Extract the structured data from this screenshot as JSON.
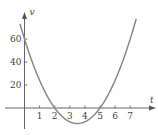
{
  "chart_data": {
    "type": "line",
    "title": "",
    "xlabel": "t",
    "ylabel": "v",
    "xlim": [
      -0.3,
      7.4
    ],
    "ylim": [
      -20,
      80
    ],
    "x_ticks": [
      1,
      2,
      3,
      4,
      5,
      6,
      7
    ],
    "x_tick_labels": [
      "1",
      "2",
      "3",
      "4",
      "5",
      "6",
      "7"
    ],
    "y_ticks": [
      20,
      40,
      60
    ],
    "y_tick_labels": [
      "20",
      "40",
      "60"
    ],
    "grid": false,
    "legend": "none",
    "series": [
      {
        "name": "v(t)",
        "equation": "v = 6t^2 - 42t + 60",
        "x": [
          -0.3,
          0,
          0.5,
          1,
          1.5,
          2,
          2.5,
          3,
          3.5,
          4,
          4.5,
          5,
          5.5,
          6,
          6.5,
          7,
          7.4
        ],
        "values": [
          73.14,
          60,
          40.5,
          24,
          10.5,
          0,
          -7.5,
          -12,
          -13.5,
          -12,
          -7.5,
          0,
          10.5,
          24,
          40.5,
          60,
          77.76
        ],
        "color": "#888888"
      }
    ],
    "roots": [
      2,
      5
    ],
    "minimum": {
      "t": 3.5,
      "v": -13.5
    }
  }
}
